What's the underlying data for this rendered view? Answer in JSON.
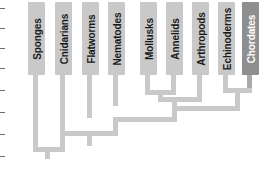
{
  "diagram": {
    "type": "cladogram",
    "title_visible": false,
    "taxa": [
      {
        "id": "sponges",
        "label": "Sponges",
        "x": 30,
        "highlighted": false
      },
      {
        "id": "cnidarians",
        "label": "Cnidarians",
        "x": 57,
        "highlighted": false
      },
      {
        "id": "flatworms",
        "label": "Flatworms",
        "x": 84,
        "highlighted": false
      },
      {
        "id": "nematodes",
        "label": "Nematodes",
        "x": 110,
        "highlighted": false
      },
      {
        "id": "mollusks",
        "label": "Mollusks",
        "x": 142,
        "highlighted": false
      },
      {
        "id": "annelids",
        "label": "Annelids",
        "x": 168,
        "highlighted": false
      },
      {
        "id": "arthropods",
        "label": "Arthropods",
        "x": 194,
        "highlighted": false
      },
      {
        "id": "echinoderms",
        "label": "Echinoderms",
        "x": 220,
        "highlighted": false
      },
      {
        "id": "chordates",
        "label": "Chordates",
        "x": 244,
        "highlighted": true
      }
    ],
    "colors": {
      "branch": "#c9c9c9",
      "branch_highlight": "#a9a9a9",
      "box": "#c9c9c9",
      "box_highlight": "#8e8e8e",
      "label_text": "#1a1a1a",
      "label_text_highlight": "#ffffff",
      "background": "#ffffff"
    },
    "axis_ticks": [
      "",
      "",
      "",
      "",
      "",
      "",
      "",
      ""
    ]
  }
}
